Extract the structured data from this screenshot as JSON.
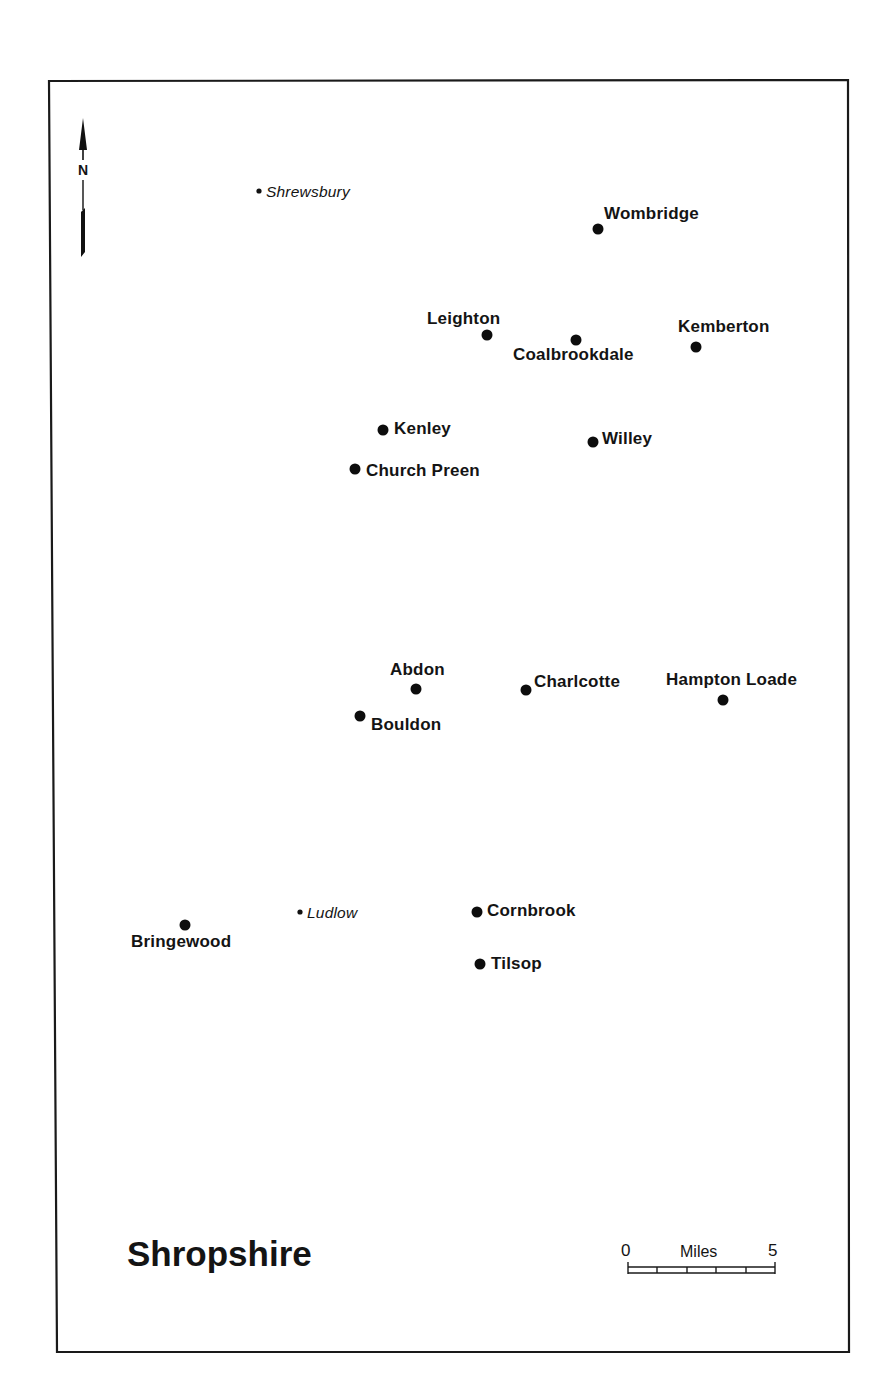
{
  "map": {
    "title": "Shropshire",
    "north_arrow": {
      "label": "N"
    },
    "scale_bar": {
      "unit_label": "Miles",
      "start_label": "0",
      "end_label": "5",
      "divisions": 5
    },
    "reference_towns": [
      {
        "name": "Shrewsbury"
      },
      {
        "name": "Ludlow"
      }
    ],
    "sites": [
      {
        "name": "Wombridge"
      },
      {
        "name": "Leighton"
      },
      {
        "name": "Coalbrookdale"
      },
      {
        "name": "Kemberton"
      },
      {
        "name": "Kenley"
      },
      {
        "name": "Willey"
      },
      {
        "name": "Church Preen"
      },
      {
        "name": "Abdon"
      },
      {
        "name": "Charlcotte"
      },
      {
        "name": "Hampton Loade"
      },
      {
        "name": "Bouldon"
      },
      {
        "name": "Bringewood"
      },
      {
        "name": "Cornbrook"
      },
      {
        "name": "Tilsop"
      }
    ]
  }
}
